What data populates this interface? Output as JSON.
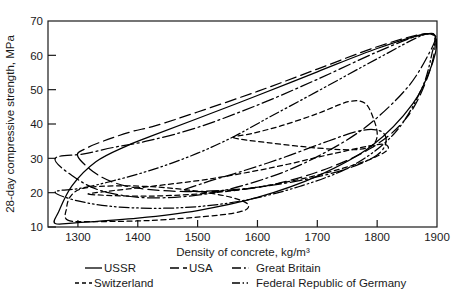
{
  "chart_data": {
    "type": "line",
    "title": "",
    "xlabel": "Density of concrete, kg/m³",
    "ylabel": "28-day compressive strength, MPa",
    "xlim": [
      1250,
      1900
    ],
    "ylim": [
      10,
      70
    ],
    "xticks": [
      1300,
      1400,
      1500,
      1600,
      1700,
      1800,
      1900
    ],
    "xticklabels": [
      "1300",
      "1400",
      "1500",
      "1600",
      "1700",
      "1800",
      "1900"
    ],
    "yticks": [
      10,
      20,
      30,
      40,
      50,
      60,
      70
    ],
    "yticklabels": [
      "10",
      "20",
      "30",
      "40",
      "50",
      "60",
      "70"
    ],
    "grid": false,
    "legend_position": "below-axes",
    "note": "Each series is a closed envelope (region boundary) of density vs 28-day compressive strength reported by that country.",
    "series": [
      {
        "name": "USSR",
        "dash": "solid",
        "dasharray": "none",
        "color": "#000000",
        "envelope": [
          [
            1262,
            11.0
          ],
          [
            1300,
            11.3
          ],
          [
            1400,
            12.6
          ],
          [
            1500,
            14.8
          ],
          [
            1600,
            18.6
          ],
          [
            1700,
            24.8
          ],
          [
            1790,
            33.5
          ],
          [
            1860,
            46.0
          ],
          [
            1893,
            58.0
          ],
          [
            1898,
            65.0
          ],
          [
            1880,
            66.2
          ],
          [
            1800,
            62.0
          ],
          [
            1700,
            55.2
          ],
          [
            1600,
            48.3
          ],
          [
            1500,
            41.6
          ],
          [
            1420,
            36.3
          ],
          [
            1380,
            33.5
          ],
          [
            1330,
            29.0
          ],
          [
            1290,
            22.0
          ],
          [
            1268,
            14.5
          ],
          [
            1262,
            11.0
          ]
        ]
      },
      {
        "name": "USA",
        "dash": "long-dash",
        "dasharray": "11,5",
        "color": "#000000",
        "envelope": [
          [
            1300,
            30.5
          ],
          [
            1340,
            24.5
          ],
          [
            1400,
            21.3
          ],
          [
            1500,
            20.3
          ],
          [
            1600,
            21.5
          ],
          [
            1700,
            26.0
          ],
          [
            1790,
            33.0
          ],
          [
            1850,
            42.0
          ],
          [
            1885,
            54.0
          ],
          [
            1897,
            64.0
          ],
          [
            1880,
            66.3
          ],
          [
            1800,
            62.5
          ],
          [
            1700,
            56.0
          ],
          [
            1600,
            49.5
          ],
          [
            1500,
            43.5
          ],
          [
            1430,
            39.5
          ],
          [
            1390,
            37.8
          ],
          [
            1350,
            35.5
          ],
          [
            1315,
            33.0
          ],
          [
            1300,
            30.5
          ]
        ]
      },
      {
        "name": "Great Britain",
        "dash": "dash-dot",
        "dasharray": "12,3.5,2,3.5",
        "color": "#000000",
        "envelope": [
          [
            1262,
            30.0
          ],
          [
            1290,
            25.0
          ],
          [
            1340,
            20.5
          ],
          [
            1420,
            18.5
          ],
          [
            1520,
            19.8
          ],
          [
            1620,
            24.5
          ],
          [
            1700,
            30.5
          ],
          [
            1780,
            39.0
          ],
          [
            1850,
            50.5
          ],
          [
            1888,
            61.0
          ],
          [
            1896,
            65.5
          ],
          [
            1870,
            65.8
          ],
          [
            1800,
            61.0
          ],
          [
            1700,
            53.0
          ],
          [
            1600,
            45.5
          ],
          [
            1500,
            39.0
          ],
          [
            1420,
            35.2
          ],
          [
            1360,
            33.2
          ],
          [
            1310,
            31.3
          ],
          [
            1262,
            30.0
          ]
        ]
      },
      {
        "name": "Switzerland",
        "dash": "short-dash",
        "dasharray": "5,3.5",
        "color": "#000000",
        "envelope": [
          [
            1283,
            12.0
          ],
          [
            1330,
            11.6
          ],
          [
            1420,
            11.9
          ],
          [
            1520,
            13.2
          ],
          [
            1570,
            14.4
          ],
          [
            1585,
            15.8
          ],
          [
            1575,
            17.6
          ],
          [
            1530,
            19.6
          ],
          [
            1450,
            21.4
          ],
          [
            1370,
            22.0
          ],
          [
            1310,
            21.3
          ],
          [
            1288,
            19.0
          ],
          [
            1281,
            15.5
          ],
          [
            1283,
            12.0
          ]
        ]
      },
      {
        "name": "Federal Republic of Germany",
        "dash": "dash-dot-dot",
        "dasharray": "10,3,1.6,3,1.6,3",
        "color": "#000000",
        "envelope": [
          [
            1262,
            20.2
          ],
          [
            1300,
            17.6
          ],
          [
            1370,
            15.8
          ],
          [
            1470,
            15.6
          ],
          [
            1570,
            17.5
          ],
          [
            1670,
            21.8
          ],
          [
            1760,
            28.0
          ],
          [
            1830,
            37.5
          ],
          [
            1875,
            50.5
          ],
          [
            1893,
            61.5
          ],
          [
            1898,
            65.5
          ],
          [
            1875,
            65.8
          ],
          [
            1800,
            59.0
          ],
          [
            1700,
            49.5
          ],
          [
            1620,
            42.0
          ],
          [
            1560,
            36.3
          ],
          [
            1500,
            31.5
          ],
          [
            1430,
            27.0
          ],
          [
            1360,
            23.5
          ],
          [
            1305,
            21.3
          ],
          [
            1262,
            20.2
          ]
        ]
      },
      {
        "name": "inner-loop-a",
        "dash": "short-dash",
        "dasharray": "5,3.5",
        "color": "#000000",
        "envelope": [
          [
            1560,
            36.0
          ],
          [
            1620,
            34.5
          ],
          [
            1700,
            33.0
          ],
          [
            1760,
            32.5
          ],
          [
            1790,
            33.6
          ],
          [
            1800,
            36.5
          ],
          [
            1795,
            41.0
          ],
          [
            1780,
            46.0
          ],
          [
            1752,
            46.5
          ],
          [
            1700,
            43.0
          ],
          [
            1640,
            39.5
          ],
          [
            1590,
            37.2
          ],
          [
            1560,
            36.0
          ]
        ]
      },
      {
        "name": "inner-loop-b",
        "dash": "dash-dot",
        "dasharray": "12,3.5,2,3.5",
        "color": "#000000",
        "envelope": [
          [
            1480,
            20.5
          ],
          [
            1570,
            21.0
          ],
          [
            1670,
            23.5
          ],
          [
            1750,
            27.0
          ],
          [
            1800,
            31.0
          ],
          [
            1815,
            35.0
          ],
          [
            1805,
            38.0
          ],
          [
            1770,
            38.0
          ],
          [
            1710,
            34.5
          ],
          [
            1640,
            30.0
          ],
          [
            1570,
            26.0
          ],
          [
            1510,
            22.8
          ],
          [
            1480,
            20.5
          ]
        ]
      },
      {
        "name": "inner-loop-c",
        "dash": "short-dash",
        "dasharray": "5,3.5",
        "color": "#000000",
        "envelope": [
          [
            1320,
            19.5
          ],
          [
            1420,
            19.0
          ],
          [
            1540,
            20.2
          ],
          [
            1660,
            23.5
          ],
          [
            1760,
            28.0
          ],
          [
            1810,
            31.5
          ],
          [
            1818,
            33.5
          ],
          [
            1800,
            34.0
          ],
          [
            1730,
            31.5
          ],
          [
            1630,
            27.5
          ],
          [
            1520,
            24.0
          ],
          [
            1420,
            21.8
          ],
          [
            1350,
            20.4
          ],
          [
            1320,
            19.5
          ]
        ]
      }
    ]
  },
  "legend": {
    "rows": [
      [
        {
          "label": "USSR",
          "style": "solid"
        },
        {
          "label": "USA",
          "style": "long-dash"
        },
        {
          "label": "Great Britain",
          "style": "dash-dot"
        }
      ],
      [
        {
          "label": "Switzerland",
          "style": "short-dash"
        },
        {
          "label": "Federal Republic of Germany",
          "style": "dash-dot-dot"
        }
      ]
    ]
  }
}
